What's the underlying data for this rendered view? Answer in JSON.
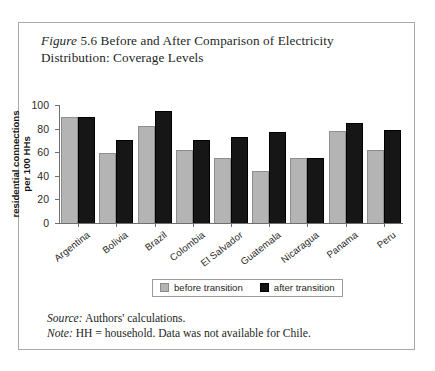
{
  "figure": {
    "label_italic": "Figure",
    "title_rest": " 5.6 Before and After Comparison of Electricity Distribution: Coverage Levels"
  },
  "footnotes": {
    "source_lead": "Source:",
    "source_text": " Authors' calculations.",
    "note_lead": "Note:",
    "note_text": " HH = household. Data was not available for Chile."
  },
  "legend": {
    "items": [
      {
        "label": "before transition",
        "color": "#b4b4b4"
      },
      {
        "label": "after transition",
        "color": "#131313"
      }
    ]
  },
  "colors": {
    "before": "#b4b4b4",
    "after": "#131313",
    "frame": "#a8a8a8",
    "axis": "#6f6f6f"
  },
  "chart_data": {
    "type": "bar",
    "title": "Figure 5.6 Before and After Comparison of Electricity Distribution: Coverage Levels",
    "xlabel": "",
    "ylabel": "residential connections per 100 HHs",
    "ylim": [
      0,
      100
    ],
    "yticks": [
      0,
      20,
      40,
      60,
      80,
      100
    ],
    "ytick_labels": [
      "0",
      "20",
      "40",
      "60",
      "80",
      "100"
    ],
    "grid": false,
    "legend_position": "bottom-center",
    "categories": [
      "Argentina",
      "Bolivia",
      "Brazil",
      "Colombia",
      "El Salvador",
      "Guatemala",
      "Nicaragua",
      "Panama",
      "Peru"
    ],
    "series": [
      {
        "name": "before transition",
        "color": "#b4b4b4",
        "values": [
          90,
          59,
          82,
          62,
          55,
          44,
          55,
          78,
          62
        ]
      },
      {
        "name": "after transition",
        "color": "#131313",
        "values": [
          90,
          70,
          95,
          70,
          73,
          77,
          55,
          85,
          79
        ]
      }
    ],
    "notes": [
      "Source: Authors' calculations.",
      "Note: HH = household. Data was not available for Chile."
    ]
  }
}
